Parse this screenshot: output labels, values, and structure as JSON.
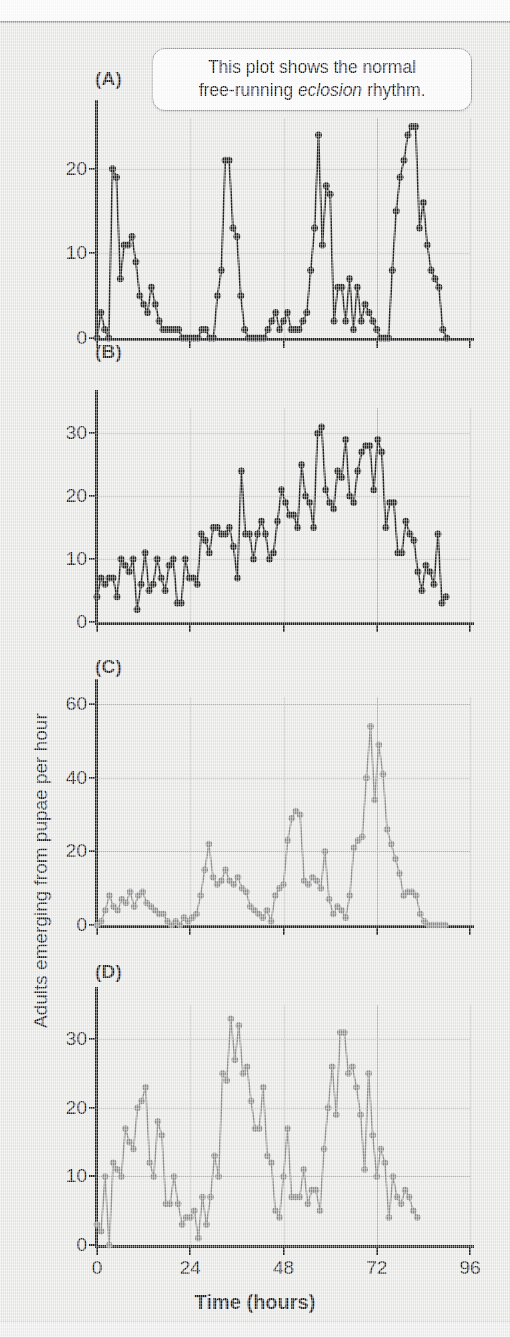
{
  "figure": {
    "y_axis_title": "Adults emerging from pupae per hour",
    "x_axis_title": "Time (hours)",
    "callout": {
      "line1": "This plot shows the normal",
      "line2_pre": "free-running ",
      "line2_em": "eclosion",
      "line2_post": " rhythm."
    }
  },
  "colors": {
    "dark_marker": "#232323",
    "light_marker": "#8e8e8e",
    "gridline": "#b9b9b7",
    "axis": "#222222",
    "background": "#e9e9e7"
  },
  "chart_data": [
    {
      "type": "line",
      "panel": "(A)",
      "title": "(A)",
      "xlabel": "Time (hours)",
      "ylabel": "Adults emerging from pupae per hour",
      "xlim": [
        0,
        96
      ],
      "ylim": [
        0,
        26
      ],
      "xticks": [
        0,
        24,
        48,
        72,
        96
      ],
      "yticks": [
        0,
        10,
        20
      ],
      "grid": true,
      "series_color": "#232323",
      "x": [
        0,
        1,
        2,
        3,
        4,
        5,
        6,
        7,
        8,
        9,
        10,
        11,
        12,
        13,
        14,
        15,
        16,
        17,
        18,
        19,
        20,
        21,
        22,
        23,
        24,
        25,
        26,
        27,
        28,
        29,
        30,
        31,
        32,
        33,
        34,
        35,
        36,
        37,
        38,
        39,
        40,
        41,
        42,
        43,
        44,
        45,
        46,
        47,
        48,
        49,
        50,
        51,
        52,
        53,
        54,
        55,
        56,
        57,
        58,
        59,
        60,
        61,
        62,
        63,
        64,
        65,
        66,
        67,
        68,
        69,
        70,
        71,
        72,
        73,
        74,
        75,
        76,
        77,
        78,
        79,
        80,
        81,
        82,
        83,
        84,
        85,
        86,
        87,
        88,
        89,
        90
      ],
      "values": [
        0,
        3,
        1,
        0,
        20,
        19,
        7,
        11,
        11,
        12,
        9,
        5,
        4,
        3,
        6,
        4,
        2,
        1,
        1,
        1,
        1,
        1,
        0,
        0,
        0,
        0,
        0,
        1,
        1,
        0,
        0,
        5,
        8,
        21,
        21,
        13,
        12,
        5,
        1,
        0,
        0,
        0,
        0,
        0,
        1,
        2,
        3,
        1,
        2,
        3,
        1,
        1,
        1,
        2,
        3,
        8,
        13,
        24,
        11,
        18,
        17,
        2,
        6,
        6,
        2,
        7,
        1,
        6,
        2,
        4,
        3,
        2,
        1,
        0,
        0,
        0,
        8,
        15,
        19,
        21,
        24,
        25,
        25,
        13,
        16,
        11,
        8,
        7,
        6,
        1,
        0
      ]
    },
    {
      "type": "line",
      "panel": "(B)",
      "title": "(B)",
      "xlabel": "Time (hours)",
      "ylabel": "Adults emerging from pupae per hour",
      "xlim": [
        0,
        96
      ],
      "ylim": [
        0,
        34
      ],
      "xticks": [
        0,
        24,
        48,
        72,
        96
      ],
      "yticks": [
        0,
        10,
        20,
        30
      ],
      "grid": true,
      "series_color": "#232323",
      "x": [
        0,
        1,
        2,
        3,
        4,
        5,
        6,
        7,
        8,
        9,
        10,
        11,
        12,
        13,
        14,
        15,
        16,
        17,
        18,
        19,
        20,
        21,
        22,
        23,
        24,
        25,
        26,
        27,
        28,
        29,
        30,
        31,
        32,
        33,
        34,
        35,
        36,
        37,
        38,
        39,
        40,
        41,
        42,
        43,
        44,
        45,
        46,
        47,
        48,
        49,
        50,
        51,
        52,
        53,
        54,
        55,
        56,
        57,
        58,
        59,
        60,
        61,
        62,
        63,
        64,
        65,
        66,
        67,
        68,
        69,
        70,
        71,
        72,
        73,
        74,
        75,
        76,
        77,
        78,
        79,
        80,
        81,
        82,
        83,
        84,
        85,
        86,
        87
      ],
      "values": [
        4,
        7,
        6,
        7,
        7,
        4,
        10,
        9,
        8,
        10,
        2,
        6,
        11,
        5,
        6,
        10,
        7,
        5,
        9,
        10,
        3,
        3,
        10,
        7,
        7,
        6,
        14,
        13,
        11,
        15,
        15,
        14,
        14,
        15,
        12,
        7,
        24,
        14,
        14,
        10,
        14,
        16,
        14,
        10,
        11,
        16,
        21,
        19,
        17,
        17,
        15,
        25,
        20,
        19,
        15,
        30,
        31,
        21,
        19,
        18,
        24,
        23,
        29,
        20,
        19,
        24,
        27,
        28,
        28,
        21,
        29,
        27,
        15,
        19,
        19,
        11,
        11,
        16,
        14,
        13,
        8,
        5,
        9,
        8,
        6,
        14,
        3,
        4
      ]
    },
    {
      "type": "line",
      "panel": "(C)",
      "title": "(C)",
      "xlabel": "Time (hours)",
      "ylabel": "Adults emerging from pupae per hour",
      "xlim": [
        0,
        96
      ],
      "ylim": [
        0,
        62
      ],
      "xticks": [
        0,
        24,
        48,
        72,
        96
      ],
      "yticks": [
        0,
        20,
        40,
        60
      ],
      "grid": true,
      "series_color": "#8e8e8e",
      "x": [
        0,
        1,
        2,
        3,
        4,
        5,
        6,
        7,
        8,
        9,
        10,
        11,
        12,
        13,
        14,
        15,
        16,
        17,
        18,
        19,
        20,
        21,
        22,
        23,
        24,
        25,
        26,
        27,
        28,
        29,
        30,
        31,
        32,
        33,
        34,
        35,
        36,
        37,
        38,
        39,
        40,
        41,
        42,
        43,
        44,
        45,
        46,
        47,
        48,
        49,
        50,
        51,
        52,
        53,
        54,
        55,
        56,
        57,
        58,
        59,
        60,
        61,
        62,
        63,
        64,
        65,
        66,
        67,
        68,
        69,
        70,
        71,
        72,
        73,
        74,
        75,
        76,
        77,
        78,
        79,
        80,
        81,
        82,
        83,
        84
      ],
      "values": [
        0,
        1,
        4,
        8,
        5,
        4,
        7,
        6,
        9,
        5,
        8,
        9,
        6,
        5,
        4,
        3,
        3,
        1,
        0,
        1,
        0,
        2,
        1,
        2,
        3,
        8,
        15,
        22,
        13,
        11,
        12,
        15,
        12,
        11,
        13,
        10,
        9,
        5,
        4,
        3,
        2,
        4,
        1,
        8,
        10,
        11,
        23,
        29,
        31,
        30,
        12,
        11,
        13,
        12,
        10,
        20,
        7,
        3,
        5,
        4,
        2,
        8,
        21,
        23,
        24,
        40,
        54,
        34,
        49,
        41,
        26,
        22,
        18,
        14,
        8,
        9,
        9,
        8,
        3,
        1,
        0,
        0,
        0,
        0,
        0
      ]
    },
    {
      "type": "line",
      "panel": "(D)",
      "title": "(D)",
      "xlabel": "Time (hours)",
      "ylabel": "Adults emerging from pupae per hour",
      "xlim": [
        0,
        96
      ],
      "ylim": [
        0,
        35
      ],
      "xticks": [
        0,
        24,
        48,
        72,
        96
      ],
      "yticks": [
        0,
        10,
        20,
        30
      ],
      "grid": true,
      "series_color": "#8e8e8e",
      "x": [
        0,
        1,
        2,
        3,
        4,
        5,
        6,
        7,
        8,
        9,
        10,
        11,
        12,
        13,
        14,
        15,
        16,
        17,
        18,
        19,
        20,
        21,
        22,
        23,
        24,
        25,
        26,
        27,
        28,
        29,
        30,
        31,
        32,
        33,
        34,
        35,
        36,
        37,
        38,
        39,
        40,
        41,
        42,
        43,
        44,
        45,
        46,
        47,
        48,
        49,
        50,
        51,
        52,
        53,
        54,
        55,
        56,
        57,
        58,
        59,
        60,
        61,
        62,
        63,
        64,
        65,
        66,
        67,
        68,
        69,
        70,
        71,
        72,
        73,
        74,
        75,
        76,
        77,
        78,
        79,
        80,
        81,
        82,
        83,
        84,
        85,
        86
      ],
      "values": [
        3,
        2,
        10,
        0,
        12,
        11,
        10,
        17,
        15,
        14,
        20,
        21,
        23,
        12,
        10,
        18,
        16,
        6,
        6,
        10,
        6,
        3,
        4,
        4,
        5,
        1,
        7,
        3,
        7,
        13,
        10,
        25,
        24,
        33,
        27,
        32,
        25,
        26,
        21,
        17,
        17,
        23,
        13,
        12,
        5,
        4,
        10,
        17,
        7,
        7,
        7,
        11,
        6,
        8,
        8,
        5,
        14,
        20,
        26,
        19,
        31,
        31,
        25,
        26,
        23,
        19,
        11,
        25,
        16,
        10,
        14,
        12,
        4,
        10,
        7,
        6,
        8,
        7,
        5,
        4
      ]
    }
  ]
}
